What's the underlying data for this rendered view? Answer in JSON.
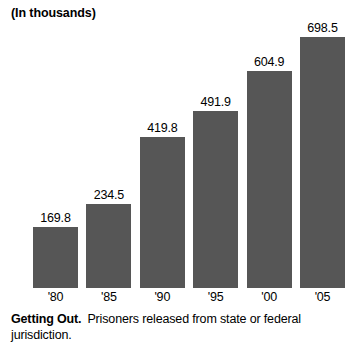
{
  "chart_data": {
    "type": "bar",
    "title": "(In thousands)",
    "categories": [
      "'80",
      "'85",
      "'90",
      "'95",
      "'00",
      "'05"
    ],
    "values": [
      169.8,
      234.5,
      419.8,
      491.9,
      604.9,
      698.5
    ],
    "value_labels": [
      "169.8",
      "234.5",
      "419.8",
      "491.9",
      "604.9",
      "698.5"
    ],
    "xlabel": "",
    "ylabel": "",
    "ylim": [
      0,
      698.5
    ],
    "grid": false,
    "legend": false,
    "bar_color": "#565656",
    "background_color": "#ffffff",
    "text_color": "#000000"
  },
  "caption": {
    "lead": "Getting Out.",
    "text": "Prisoners released from state or federal jurisdiction."
  }
}
